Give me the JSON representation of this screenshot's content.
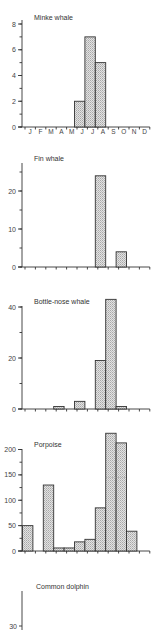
{
  "figure": {
    "months": [
      "J",
      "F",
      "M",
      "A",
      "M",
      "J",
      "J",
      "A",
      "S",
      "O",
      "N",
      "D"
    ]
  },
  "chart_data": [
    {
      "type": "bar",
      "title": "Minke whale",
      "categories": [
        "Jan",
        "Feb",
        "Mar",
        "Apr",
        "May",
        "Jun",
        "Jul",
        "Aug",
        "Sep",
        "Oct",
        "Nov",
        "Dec"
      ],
      "x_tick_labels": [
        "J",
        "F",
        "M",
        "A",
        "M",
        "J",
        "J",
        "A",
        "S",
        "O",
        "N",
        "D"
      ],
      "values": [
        0,
        0,
        0,
        0,
        0,
        2,
        7,
        5,
        0,
        0,
        0,
        0
      ],
      "ylim": [
        0,
        8
      ],
      "yticks": [
        0,
        2,
        4,
        6,
        8
      ],
      "xlabel": "",
      "ylabel": "",
      "grid": false,
      "legend": null
    },
    {
      "type": "bar",
      "title": "Fin whale",
      "categories": [
        "Jan",
        "Feb",
        "Mar",
        "Apr",
        "May",
        "Jun",
        "Jul",
        "Aug",
        "Sep",
        "Oct",
        "Nov",
        "Dec"
      ],
      "values": [
        0,
        0,
        0,
        0,
        0,
        0,
        0,
        24,
        0,
        4,
        0,
        0
      ],
      "ylim": [
        0,
        26
      ],
      "yticks": [
        0,
        10,
        20
      ],
      "xlabel": "",
      "ylabel": "",
      "grid": false,
      "legend": null
    },
    {
      "type": "bar",
      "title": "Bottle-nose whale",
      "categories": [
        "Jan",
        "Feb",
        "Mar",
        "Apr",
        "May",
        "Jun",
        "Jul",
        "Aug",
        "Sep",
        "Oct",
        "Nov",
        "Dec"
      ],
      "values": [
        0,
        0,
        0,
        1,
        0,
        3,
        0,
        19,
        43,
        1,
        0,
        0
      ],
      "ylim": [
        0,
        40
      ],
      "yticks": [
        0,
        20,
        40
      ],
      "xlabel": "",
      "ylabel": "",
      "grid": false,
      "legend": null
    },
    {
      "type": "bar",
      "title": "Porpoise",
      "categories": [
        "Jan",
        "Feb",
        "Mar",
        "Apr",
        "May",
        "Jun",
        "Jul",
        "Aug",
        "Sep",
        "Oct",
        "Nov",
        "Dec"
      ],
      "values": [
        50,
        0,
        130,
        6,
        6,
        18,
        23,
        85,
        232,
        213,
        39,
        0
      ],
      "ylim": [
        0,
        200
      ],
      "yticks": [
        0,
        50,
        100,
        150,
        200
      ],
      "annotations": [
        "dashed line at ~145 within Sep and Oct bars"
      ],
      "xlabel": "",
      "ylabel": "",
      "grid": false,
      "legend": null
    },
    {
      "type": "bar",
      "title": "Common dolphin",
      "categories": [
        "Jan",
        "Feb",
        "Mar",
        "Apr",
        "May",
        "Jun",
        "Jul",
        "Aug",
        "Sep",
        "Oct",
        "Nov",
        "Dec"
      ],
      "values": [],
      "yticks_visible": [
        30
      ],
      "note": "panel truncated at bottom of image",
      "xlabel": "",
      "ylabel": "",
      "grid": false,
      "legend": null
    }
  ]
}
